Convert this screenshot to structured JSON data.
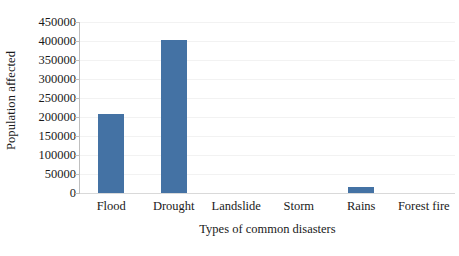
{
  "chart_data": {
    "type": "bar",
    "title": "",
    "subtitle": "",
    "xlabel": "Types of common disasters",
    "ylabel": "Population affected",
    "categories": [
      "Flood",
      "Drought",
      "Landslide",
      "Storm",
      "Rains",
      "Forest fire"
    ],
    "values": [
      208000,
      403000,
      0,
      0,
      16000,
      0
    ],
    "series": [
      {
        "name": "Population affected",
        "values": [
          208000,
          403000,
          0,
          0,
          16000,
          0
        ]
      }
    ],
    "ylim": [
      0,
      450000
    ],
    "ytick_values": [
      0,
      50000,
      100000,
      150000,
      200000,
      250000,
      300000,
      350000,
      400000,
      450000
    ],
    "ytick_labels": [
      "0",
      "50000",
      "100000",
      "150000",
      "200000",
      "250000",
      "300000",
      "350000",
      "400000",
      "450000"
    ],
    "grid": true,
    "grid_axis": "y",
    "legend": false,
    "legend_position": "none",
    "bar_color": "#4472A4",
    "gridline_color": "#F2F2F2",
    "axis_color": "#BFBFBF",
    "background_color": "#FFFFFF",
    "annotations": []
  }
}
